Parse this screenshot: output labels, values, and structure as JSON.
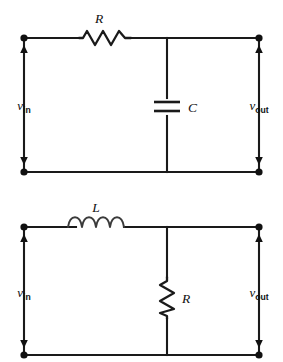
{
  "figure": {
    "background_color": "#ffffff",
    "line_color": "#111111",
    "circuits": [
      {
        "id": "rc-low-pass",
        "name": "RC low-pass filter",
        "series_element": {
          "type": "resistor",
          "label": "R",
          "icon": "resistor-zigzag-icon"
        },
        "shunt_element": {
          "type": "capacitor",
          "label": "C",
          "icon": "capacitor-plates-icon"
        },
        "input_port": {
          "label_symbol": "v",
          "label_subscript": "in"
        },
        "output_port": {
          "label_symbol": "v",
          "label_subscript": "out"
        }
      },
      {
        "id": "lr-low-pass",
        "name": "LR low-pass filter",
        "series_element": {
          "type": "inductor",
          "label": "L",
          "icon": "inductor-coil-icon"
        },
        "shunt_element": {
          "type": "resistor",
          "label": "R",
          "icon": "resistor-zigzag-icon"
        },
        "input_port": {
          "label_symbol": "v",
          "label_subscript": "in"
        },
        "output_port": {
          "label_symbol": "v",
          "label_subscript": "out"
        }
      }
    ]
  }
}
